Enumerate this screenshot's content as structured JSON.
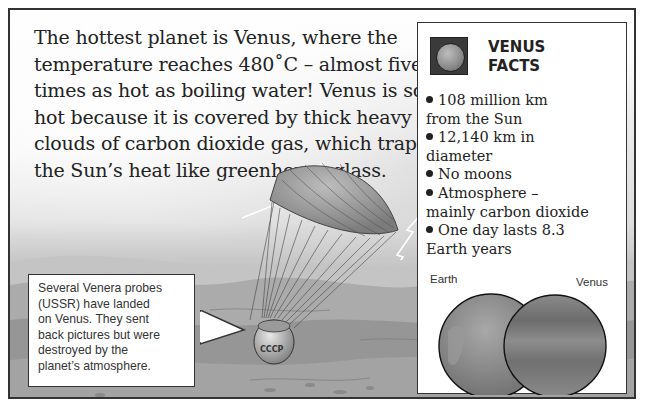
{
  "intro": {
    "lines": [
      "The hottest planet is Venus, where the",
      "temperature reaches 480˚C – almost five",
      "times as hot as boiling water! Venus is so",
      "hot because it is covered by thick heavy",
      "clouds of carbon dioxide gas, which trap",
      "the Sun’s heat like greenhouse glass."
    ]
  },
  "facts": {
    "icon": "venus-planet-icon",
    "title_line1": "VENUS",
    "title_line2": "FACTS",
    "items": [
      {
        "line1": "108 million km",
        "line2": "from the Sun"
      },
      {
        "line1": "12,140 km in",
        "line2": "diameter"
      },
      {
        "line1": "No moons",
        "line2": ""
      },
      {
        "line1": "Atmosphere –",
        "line2": "mainly carbon dioxide"
      },
      {
        "line1": "One day lasts 8.3",
        "line2": "Earth years"
      }
    ],
    "comparison": {
      "left_label": "Earth",
      "right_label": "Venus"
    }
  },
  "callout": {
    "lines": [
      "Several Venera probes",
      "(USSR) have landed",
      "on Venus. They sent",
      "back pictures but were",
      "destroyed by the",
      "planet’s atmosphere."
    ]
  },
  "probe": {
    "label": "CCCP"
  }
}
